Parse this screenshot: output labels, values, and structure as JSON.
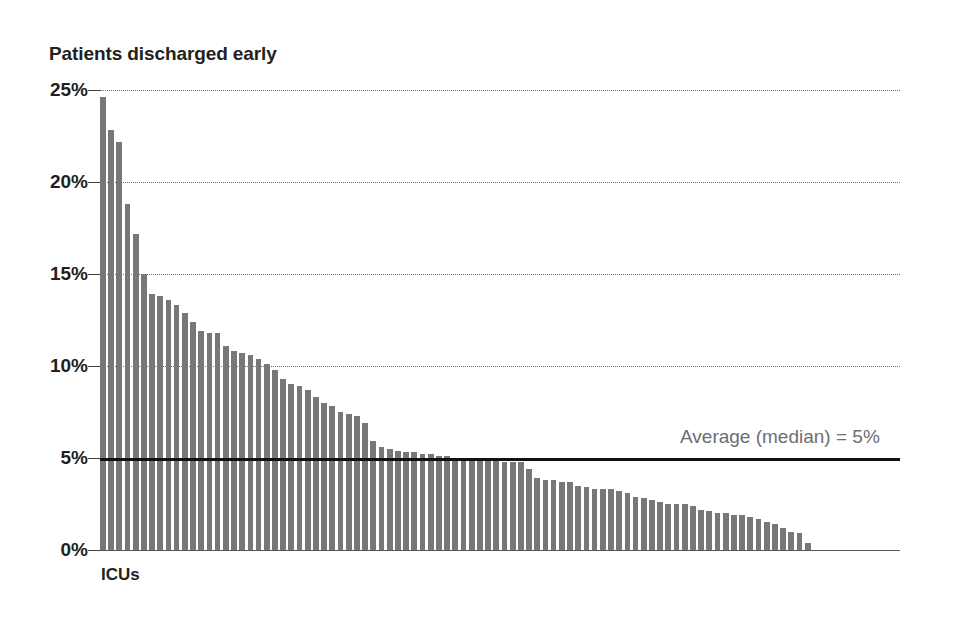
{
  "chart_data": {
    "type": "bar",
    "title": "Patients discharged early",
    "xlabel": "ICUs",
    "ylabel": "",
    "ylim": [
      0,
      25
    ],
    "xlim": [
      0,
      87
    ],
    "grid": true,
    "legend": false,
    "value_unit": "%",
    "ytick_labels": [
      "25%",
      "20%",
      "15%",
      "10%",
      "5%",
      "0%"
    ],
    "yticks": [
      25,
      20,
      15,
      10,
      5,
      0
    ],
    "gridline_values": [
      25,
      20,
      15,
      10
    ],
    "annotations": [
      {
        "name": "median-reference",
        "text": "Average (median) = 5%",
        "value": 5,
        "line_style": "solid",
        "color": "#111111"
      }
    ],
    "bar_color": "#77777a",
    "categories": [
      "ICU 1",
      "ICU 2",
      "ICU 3",
      "ICU 4",
      "ICU 5",
      "ICU 6",
      "ICU 7",
      "ICU 8",
      "ICU 9",
      "ICU 10",
      "ICU 11",
      "ICU 12",
      "ICU 13",
      "ICU 14",
      "ICU 15",
      "ICU 16",
      "ICU 17",
      "ICU 18",
      "ICU 19",
      "ICU 20",
      "ICU 21",
      "ICU 22",
      "ICU 23",
      "ICU 24",
      "ICU 25",
      "ICU 26",
      "ICU 27",
      "ICU 28",
      "ICU 29",
      "ICU 30",
      "ICU 31",
      "ICU 32",
      "ICU 33",
      "ICU 34",
      "ICU 35",
      "ICU 36",
      "ICU 37",
      "ICU 38",
      "ICU 39",
      "ICU 40",
      "ICU 41",
      "ICU 42",
      "ICU 43",
      "ICU 44",
      "ICU 45",
      "ICU 46",
      "ICU 47",
      "ICU 48",
      "ICU 49",
      "ICU 50",
      "ICU 51",
      "ICU 52",
      "ICU 53",
      "ICU 54",
      "ICU 55",
      "ICU 56",
      "ICU 57",
      "ICU 58",
      "ICU 59",
      "ICU 60",
      "ICU 61",
      "ICU 62",
      "ICU 63",
      "ICU 64",
      "ICU 65",
      "ICU 66",
      "ICU 67",
      "ICU 68",
      "ICU 69",
      "ICU 70",
      "ICU 71",
      "ICU 72",
      "ICU 73",
      "ICU 74",
      "ICU 75",
      "ICU 76",
      "ICU 77",
      "ICU 78",
      "ICU 79",
      "ICU 80",
      "ICU 81",
      "ICU 82",
      "ICU 83",
      "ICU 84",
      "ICU 85",
      "ICU 86",
      "ICU 87"
    ],
    "values": [
      24.6,
      22.8,
      22.2,
      18.8,
      17.2,
      15.0,
      13.9,
      13.8,
      13.6,
      13.3,
      12.9,
      12.4,
      11.9,
      11.8,
      11.8,
      11.1,
      10.8,
      10.7,
      10.6,
      10.4,
      10.1,
      9.8,
      9.3,
      9.0,
      8.9,
      8.7,
      8.3,
      8.0,
      7.8,
      7.5,
      7.4,
      7.3,
      6.9,
      5.9,
      5.6,
      5.5,
      5.4,
      5.3,
      5.3,
      5.2,
      5.2,
      5.1,
      5.1,
      5.0,
      4.9,
      4.9,
      4.9,
      4.9,
      4.9,
      4.8,
      4.8,
      4.8,
      4.4,
      3.9,
      3.8,
      3.8,
      3.7,
      3.7,
      3.5,
      3.4,
      3.3,
      3.3,
      3.3,
      3.2,
      3.1,
      2.9,
      2.8,
      2.7,
      2.6,
      2.5,
      2.5,
      2.5,
      2.4,
      2.2,
      2.1,
      2.0,
      2.0,
      1.9,
      1.9,
      1.8,
      1.7,
      1.5,
      1.4,
      1.2,
      1.0,
      0.9,
      0.4
    ]
  }
}
